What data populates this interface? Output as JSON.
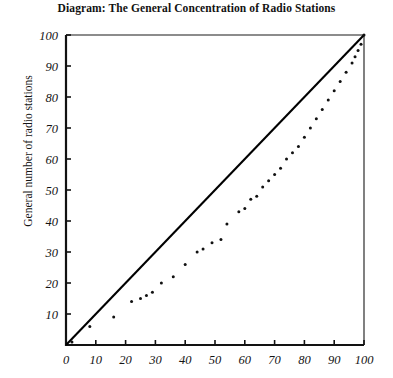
{
  "chart_data": {
    "type": "scatter",
    "title": "Diagram: The General Concentration of Radio Stations",
    "xlabel": "",
    "ylabel": "General number of radio stations",
    "xlim": [
      0,
      100
    ],
    "ylim": [
      0,
      100
    ],
    "xticks": [
      0,
      10,
      20,
      30,
      40,
      50,
      60,
      70,
      80,
      90,
      100
    ],
    "yticks": [
      0,
      10,
      20,
      30,
      40,
      50,
      60,
      70,
      80,
      90,
      100
    ],
    "xtick_labels": [
      "0",
      "10",
      "20",
      "30",
      "40",
      "50",
      "60",
      "70",
      "80",
      "90",
      "100"
    ],
    "ytick_labels": [
      "0",
      "10",
      "20",
      "30",
      "40",
      "50",
      "60",
      "70",
      "80",
      "90",
      "100"
    ],
    "grid": false,
    "legend": null,
    "series": [
      {
        "name": "Equality line",
        "type": "line",
        "style": "solid",
        "color": "#000000",
        "x": [
          0,
          100
        ],
        "y": [
          0,
          100
        ]
      },
      {
        "name": "Concentration curve",
        "type": "scatter",
        "marker": "dot",
        "color": "#111111",
        "points": [
          [
            2,
            1
          ],
          [
            8,
            6
          ],
          [
            16,
            9
          ],
          [
            22,
            14
          ],
          [
            25,
            15
          ],
          [
            27,
            16
          ],
          [
            29,
            17
          ],
          [
            32,
            20
          ],
          [
            36,
            22
          ],
          [
            40,
            26
          ],
          [
            44,
            30
          ],
          [
            46,
            31
          ],
          [
            49,
            33
          ],
          [
            52,
            34
          ],
          [
            54,
            39
          ],
          [
            58,
            43
          ],
          [
            60,
            44
          ],
          [
            62,
            47
          ],
          [
            64,
            48
          ],
          [
            66,
            51
          ],
          [
            68,
            53
          ],
          [
            70,
            55
          ],
          [
            72,
            57
          ],
          [
            74,
            60
          ],
          [
            76,
            62
          ],
          [
            78,
            64
          ],
          [
            80,
            67
          ],
          [
            82,
            70
          ],
          [
            84,
            73
          ],
          [
            86,
            76
          ],
          [
            88,
            79
          ],
          [
            90,
            82
          ],
          [
            92,
            85
          ],
          [
            94,
            88
          ],
          [
            96,
            91
          ],
          [
            97,
            93
          ],
          [
            98,
            95
          ],
          [
            99,
            97
          ],
          [
            100,
            100
          ]
        ]
      }
    ]
  }
}
